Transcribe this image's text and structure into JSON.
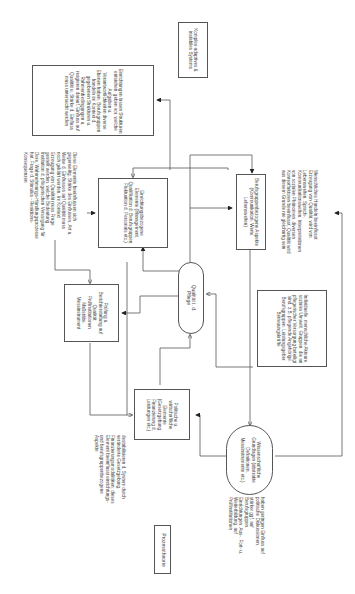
{
  "diagram": {
    "title": "Prozesstheorie",
    "nodes": {
      "system": "Komplex-adaptives & instabiles Systems",
      "institution_frame": "Einrichtungen lassen Strukturen entstehen, geben vor, welche Aufgaben u. Verantwortlichkeiten diverse Ebenen haben. Berufsgruppen handeln im Kontext d. gegebenen Strukturen u. Rahmenbedingungen u. reagieren darauf. Einfluss auf Qualität u. Stärke d. Einfluss muss untersucht werden",
      "institution_elements": "Einrichtungsbezogene Elemente (Management, Qualifikation d. Berufsgruppen, Fluktuation d. Personals etc.)",
      "profession_aspects": "Berufsgruppenbezogene Aspekte (Kommunikation, Werte, Lebenswelten)",
      "quality": "Qualität i. d. Pflege",
      "review": "Prüfung u. Berichterstattung auf Qualität; Prüfinstitutionen, Maßstäbe, Messinstrument",
      "individuals": "Individuelle, menschliche Akteure, soziales Umwelt, Gruppen, die an pflegerischer Versorgung beteiligt sind, z.B. pflegende Angehörige, Berufsgruppen, Leistungsgeber, Betreuungskräfte",
      "political": "Politische u. wirtschaftliche Elemente (Gesetzgebung, Finanzierung d. Leistungen etc.)",
      "science": "Wissenschaftliche Grundlagen (abstrakte Definitionen, Messinstrumente etc.)"
    },
    "annotations": {
      "elements_influence": "Diese Elemente beeinflussen sich gegenseitig. Stärke des Einflusses, Art u. Weise d. Einflusses auf Qualität muss noch geklärt werden. Im Kontext Erzeugung von Qualität muss Frage gestellt werden, welche Bedeutung Institution d. pflegerischen Versorgung für Dere. Wahrnehmungs-Handlungsprozesse hat. Frage d. Stimulus - Reaktions-Konsequenzen",
      "human_action": "Menschliches Handeln beeinflusst Erzeugung von Qualität, wird von Lebenswelten, Sprach-, Kommunikationswelten, Interpretationen von sozialen Phänomen, diversen Kontextfaktoren beeinflusst. Qualität wird aus diesem Grunde nie gleichartig sein",
      "destabilize": "destabilisieren d. System durch veränderte Gesetzgebung, Finanzierungsmodalitäten; dieses Element beeinflusst einrichtungs- und berufsgruppenbezogene Aspekte",
      "science_influence": "haben geringen Einfluss auf politische Diskussionen, stärker ggf. auf Berufsgruppen, Einrichtungen, Aus-, Fort- u. Weiterbildung, auf Prüfinstitutionen"
    },
    "colors": {
      "line": "#555555",
      "text": "#444444",
      "background": "#ffffff"
    }
  }
}
